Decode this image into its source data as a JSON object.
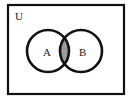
{
  "diagram": {
    "type": "venn",
    "universe": {
      "label": "U"
    },
    "sets": [
      {
        "label": "A"
      },
      {
        "label": "B"
      }
    ],
    "shaded_region": "A ∩ B",
    "colors": {
      "stroke": "#111111",
      "shade": "#9a9a9a",
      "background": "#ffffff"
    }
  }
}
